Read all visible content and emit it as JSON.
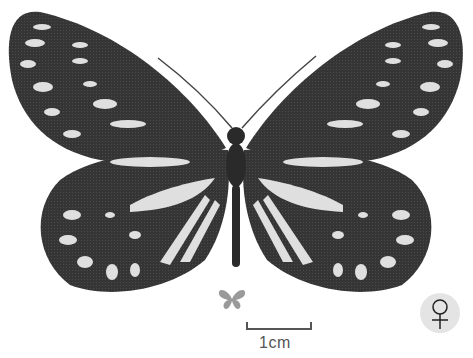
{
  "image": {
    "subject": "butterfly specimen, dorsal view",
    "tone": "grayscale"
  },
  "scale_bar": {
    "label": "1cm"
  },
  "life_size_icon": {
    "name": "butterfly-silhouette",
    "color": "#9a9a9a"
  },
  "sex_symbol": {
    "glyph": "♀",
    "meaning": "female",
    "badge_color": "#e4e4e4"
  },
  "colors": {
    "wing_dark": "#2e2e2e",
    "wing_mid": "#4a4a4a",
    "spots": "#efefef",
    "scale_bar": "#555555"
  }
}
